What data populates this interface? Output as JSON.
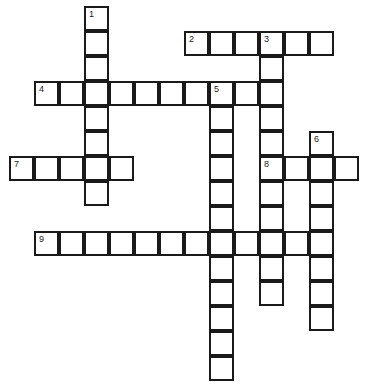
{
  "puzzle": {
    "origin_x": 10,
    "origin_y": 7,
    "cell_size": 25,
    "border_color": "#1a1a1a",
    "entries": [
      {
        "number": "1",
        "direction": "down",
        "row": 0,
        "col": 3,
        "length": 8
      },
      {
        "number": "2",
        "direction": "across",
        "row": 1,
        "col": 7,
        "length": 6
      },
      {
        "number": "3",
        "direction": "down",
        "row": 1,
        "col": 10,
        "length": 11
      },
      {
        "number": "4",
        "direction": "across",
        "row": 3,
        "col": 1,
        "length": 10
      },
      {
        "number": "5",
        "direction": "down",
        "row": 3,
        "col": 8,
        "length": 12
      },
      {
        "number": "6",
        "direction": "down",
        "row": 5,
        "col": 12,
        "length": 8
      },
      {
        "number": "7",
        "direction": "across",
        "row": 6,
        "col": 0,
        "length": 5
      },
      {
        "number": "8",
        "direction": "across",
        "row": 6,
        "col": 10,
        "length": 4
      },
      {
        "number": "9",
        "direction": "across",
        "row": 9,
        "col": 1,
        "length": 12
      }
    ]
  }
}
